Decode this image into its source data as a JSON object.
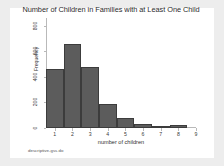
{
  "figure": {
    "background_color": "#ededed",
    "canvas_color": "#ffffff",
    "caption": "descriptive-gss.do"
  },
  "chart_data": {
    "type": "bar",
    "title": "Number of Children in Families with at Least One Child",
    "xlabel": "number of children",
    "ylabel": "Frequency",
    "categories": [
      "1",
      "2",
      "3",
      "4",
      "5",
      "6",
      "7",
      "8"
    ],
    "values": [
      460,
      660,
      480,
      190,
      75,
      30,
      18,
      22
    ],
    "x_tick_labels": [
      "1",
      "2",
      "3",
      "4",
      "5",
      "6",
      "7",
      "8",
      "9"
    ],
    "y_tick_labels": [
      "0",
      "200",
      "400",
      "600",
      "800"
    ],
    "y_tick_values": [
      0,
      200,
      400,
      600,
      800
    ],
    "ylim": [
      0,
      860
    ],
    "xlim": [
      0.5,
      9.0
    ],
    "grid": false,
    "legend": "none",
    "bar_color": "#5c5c5c",
    "bar_edge_color": "#3c3c3c",
    "axis_color": "#b9b9b9"
  }
}
